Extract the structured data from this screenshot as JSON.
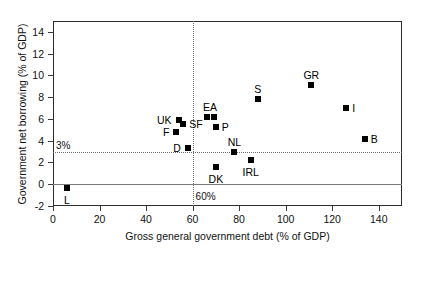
{
  "chart_data": {
    "type": "scatter",
    "title": "",
    "xlabel": "Gross general government debt (% of GDP)",
    "ylabel": "Government net borrowing (% of GDP)",
    "xlim": [
      0,
      150
    ],
    "ylim": [
      -2,
      15
    ],
    "xticks": [
      0,
      20,
      40,
      60,
      80,
      100,
      120,
      140
    ],
    "yticks": [
      -2,
      0,
      2,
      4,
      6,
      8,
      10,
      12,
      14
    ],
    "grid": false,
    "legend": "none",
    "reference_lines": [
      {
        "axis": "y",
        "value": 3,
        "label": "3%",
        "style": "dotted"
      },
      {
        "axis": "x",
        "value": 60,
        "label": "60%",
        "style": "dotted"
      },
      {
        "axis": "y",
        "value": 0,
        "label": "",
        "style": "solid"
      }
    ],
    "points": [
      {
        "label": "L",
        "x": 6,
        "y": -0.3,
        "label_pos": "below"
      },
      {
        "label": "D",
        "x": 58,
        "y": 3.3,
        "label_pos": "left"
      },
      {
        "label": "F",
        "x": 53,
        "y": 4.8,
        "label_pos": "left"
      },
      {
        "label": "SF",
        "x": 56,
        "y": 5.5,
        "label_pos": "right"
      },
      {
        "label": "UK",
        "x": 54,
        "y": 5.9,
        "label_pos": "left"
      },
      {
        "label": "E",
        "x": 66,
        "y": 6.2,
        "label_pos": "above"
      },
      {
        "label": "A",
        "x": 69,
        "y": 6.2,
        "label_pos": "above"
      },
      {
        "label": "P",
        "x": 70,
        "y": 5.3,
        "label_pos": "right"
      },
      {
        "label": "S",
        "x": 88,
        "y": 7.8,
        "label_pos": "above"
      },
      {
        "label": "NL",
        "x": 78,
        "y": 3.0,
        "label_pos": "above"
      },
      {
        "label": "DK",
        "x": 70,
        "y": 1.6,
        "label_pos": "below"
      },
      {
        "label": "IRL",
        "x": 85,
        "y": 2.2,
        "label_pos": "below"
      },
      {
        "label": "GR",
        "x": 111,
        "y": 9.1,
        "label_pos": "above"
      },
      {
        "label": "I",
        "x": 126,
        "y": 7.0,
        "label_pos": "right"
      },
      {
        "label": "B",
        "x": 134,
        "y": 4.2,
        "label_pos": "right"
      }
    ]
  }
}
